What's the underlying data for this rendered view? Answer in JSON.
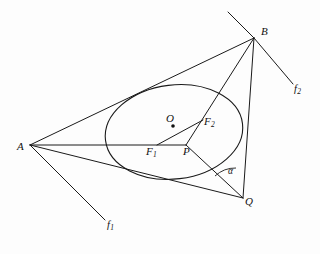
{
  "figure": {
    "type": "geometry-diagram",
    "background_color": "#fdfdfd",
    "stroke_color": "#1a1a1a"
  },
  "points": [
    {
      "id": "A",
      "label": "A",
      "x": 30,
      "y": 145,
      "label_x": 17,
      "label_y": 141,
      "dot": false
    },
    {
      "id": "B",
      "label": "B",
      "x": 254,
      "y": 38,
      "label_x": 261,
      "label_y": 26,
      "dot": false
    },
    {
      "id": "O",
      "label": "O",
      "x": 173,
      "y": 126,
      "label_x": 166,
      "label_y": 113,
      "dot": true
    },
    {
      "id": "F1",
      "label": "F",
      "sub": "1",
      "x": 157,
      "y": 145,
      "label_x": 146,
      "label_y": 146,
      "dot": false
    },
    {
      "id": "F2",
      "label": "F",
      "sub": "2",
      "x": 203,
      "y": 120,
      "label_x": 204,
      "label_y": 116,
      "dot": false
    },
    {
      "id": "P",
      "label": "P",
      "x": 186,
      "y": 145,
      "label_x": 183,
      "label_y": 146,
      "dot": false
    },
    {
      "id": "Q",
      "label": "Q",
      "x": 243,
      "y": 198,
      "label_x": 245,
      "label_y": 196,
      "dot": false
    }
  ],
  "angle": {
    "id": "alpha",
    "label": "α",
    "label_x": 228,
    "label_y": 167,
    "vertex": "Q",
    "arc_radius": 30
  },
  "rays": [
    {
      "id": "f1",
      "label": "f",
      "sub": "1",
      "from": "A",
      "to_x": 105,
      "to_y": 220,
      "label_x": 107,
      "label_y": 220
    },
    {
      "id": "f2",
      "label": "f",
      "sub": "2",
      "from": "B",
      "to_x": 293,
      "to_y": 84,
      "label_x": 294,
      "label_y": 84
    }
  ],
  "segments": [
    {
      "name": "A-to-B-tangent",
      "from": "A",
      "to": "B"
    },
    {
      "name": "A-to-P-horizontal",
      "from": "A",
      "to": "P"
    },
    {
      "name": "A-to-Q-tangent",
      "from": "A",
      "to": "Q"
    },
    {
      "name": "B-to-Q-side",
      "from": "B",
      "to": "Q"
    },
    {
      "name": "B-to-P-through-F2",
      "from": "B",
      "to": "P"
    },
    {
      "name": "P-to-Q",
      "from": "P",
      "to": "Q"
    },
    {
      "name": "F1-to-F2-focal-axis",
      "from": "F1",
      "to": "F2"
    },
    {
      "name": "B-upper-left-extension",
      "from": "B",
      "to_x": 228,
      "to_y": 12
    }
  ],
  "ellipse": {
    "name": "inscribed-ellipse",
    "center_x": 174,
    "center_y": 132,
    "radius_x": 69,
    "radius_y": 47,
    "rotation_deg": -7
  }
}
